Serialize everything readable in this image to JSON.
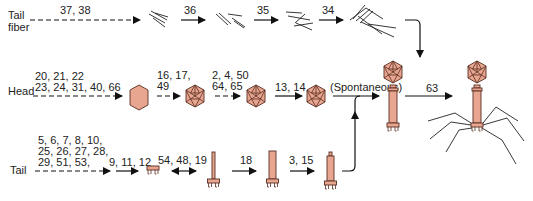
{
  "rows": {
    "tail_fiber": {
      "label_line1": "Tail",
      "label_line2": "fiber",
      "steps": [
        {
          "genes": "37, 38",
          "arrow": "dashed"
        },
        {
          "genes": "36",
          "arrow": "solid"
        },
        {
          "genes": "35",
          "arrow": "solid"
        },
        {
          "genes": "34",
          "arrow": "solid"
        }
      ]
    },
    "head": {
      "label": "Head",
      "steps": [
        {
          "genes_line1": "20, 21, 22",
          "genes_line2": "23, 24, 31, 40, 66",
          "arrow": "dashed"
        },
        {
          "genes_line1": "16, 17,",
          "genes_line2": "49",
          "arrow": "dashed"
        },
        {
          "genes_line1": "2, 4, 50",
          "genes_line2": "64, 65",
          "arrow": "dashed"
        },
        {
          "genes": "13, 14",
          "arrow": "solid"
        },
        {
          "genes": "(Spontaneous)",
          "arrow": "solid"
        }
      ]
    },
    "tail": {
      "label": "Tail",
      "steps": [
        {
          "genes_line1": "5, 6, 7, 8, 10,",
          "genes_line2": "25, 26, 27, 28,",
          "genes_line3": "29, 51, 53,",
          "arrow": "dashed"
        },
        {
          "genes": "9, 11, 12",
          "arrow": "solid"
        },
        {
          "genes": "54, 48, 19",
          "arrow": "double"
        },
        {
          "genes": "18",
          "arrow": "solid"
        },
        {
          "genes": "3, 15",
          "arrow": "solid"
        }
      ]
    },
    "final": {
      "genes": "63",
      "arrow": "solid"
    }
  },
  "colors": {
    "component_fill": "#e8a690",
    "component_stroke": "#5a2e22",
    "line": "#111111"
  }
}
